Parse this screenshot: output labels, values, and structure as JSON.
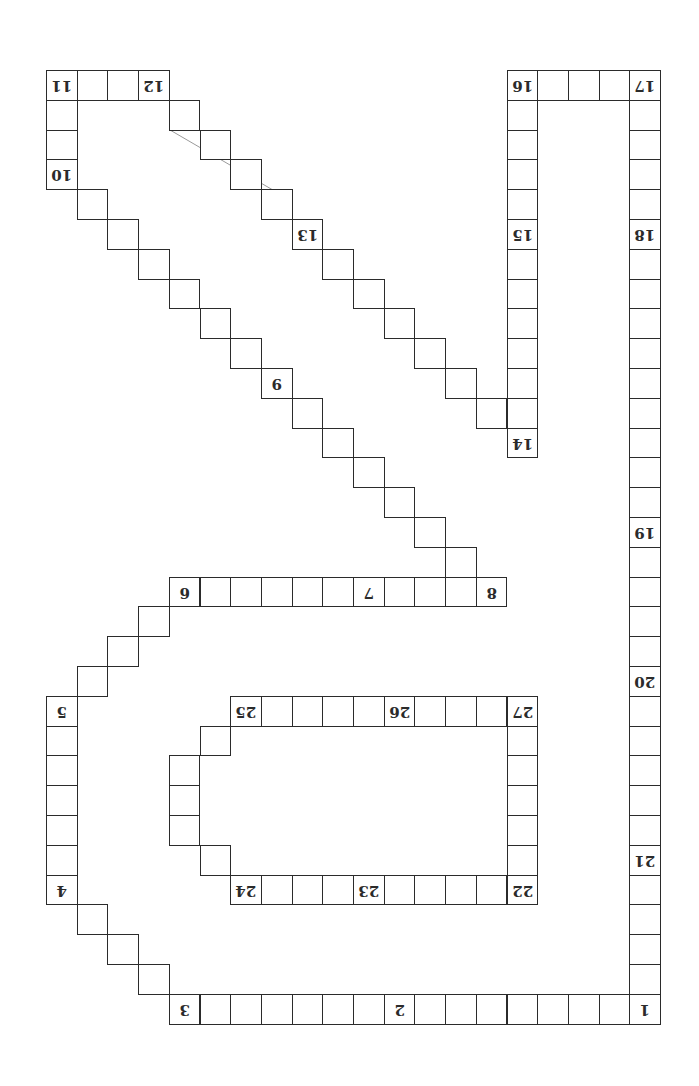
{
  "board": {
    "orientation": "rotated-180",
    "grid": {
      "origin_x": 46,
      "origin_y": 70,
      "col_width": 30.7,
      "row_height": 29.8
    },
    "colors": {
      "line": "#2b2b2b",
      "background": "#ffffff",
      "stray_line": "#9a9a9a"
    },
    "path_cells": [
      {
        "c": 19,
        "r": 31,
        "label": "1"
      },
      {
        "c": 18,
        "r": 31
      },
      {
        "c": 17,
        "r": 31
      },
      {
        "c": 16,
        "r": 31
      },
      {
        "c": 15,
        "r": 31
      },
      {
        "c": 14,
        "r": 31
      },
      {
        "c": 13,
        "r": 31
      },
      {
        "c": 12,
        "r": 31
      },
      {
        "c": 11,
        "r": 31,
        "label": "2"
      },
      {
        "c": 10,
        "r": 31
      },
      {
        "c": 9,
        "r": 31
      },
      {
        "c": 8,
        "r": 31
      },
      {
        "c": 7,
        "r": 31
      },
      {
        "c": 6,
        "r": 31
      },
      {
        "c": 5,
        "r": 31
      },
      {
        "c": 4,
        "r": 31,
        "label": "3"
      },
      {
        "c": 3,
        "r": 30
      },
      {
        "c": 2,
        "r": 29
      },
      {
        "c": 1,
        "r": 28
      },
      {
        "c": 0,
        "r": 27,
        "label": "4"
      },
      {
        "c": 0,
        "r": 26
      },
      {
        "c": 0,
        "r": 25
      },
      {
        "c": 0,
        "r": 24
      },
      {
        "c": 0,
        "r": 23
      },
      {
        "c": 0,
        "r": 22
      },
      {
        "c": 0,
        "r": 21,
        "label": "5"
      },
      {
        "c": 1,
        "r": 20
      },
      {
        "c": 2,
        "r": 19
      },
      {
        "c": 3,
        "r": 18
      },
      {
        "c": 4,
        "r": 17,
        "label": "6"
      },
      {
        "c": 5,
        "r": 17
      },
      {
        "c": 6,
        "r": 17
      },
      {
        "c": 7,
        "r": 17
      },
      {
        "c": 8,
        "r": 17
      },
      {
        "c": 9,
        "r": 17
      },
      {
        "c": 10,
        "r": 17,
        "label": "7"
      },
      {
        "c": 11,
        "r": 17
      },
      {
        "c": 12,
        "r": 17
      },
      {
        "c": 13,
        "r": 17
      },
      {
        "c": 14,
        "r": 17,
        "label": "8"
      },
      {
        "c": 13,
        "r": 16
      },
      {
        "c": 12,
        "r": 15
      },
      {
        "c": 11,
        "r": 14
      },
      {
        "c": 10,
        "r": 13
      },
      {
        "c": 9,
        "r": 12
      },
      {
        "c": 8,
        "r": 11
      },
      {
        "c": 7,
        "r": 10,
        "label": "9"
      },
      {
        "c": 6,
        "r": 9
      },
      {
        "c": 5,
        "r": 8
      },
      {
        "c": 4,
        "r": 7
      },
      {
        "c": 3,
        "r": 6
      },
      {
        "c": 2,
        "r": 5
      },
      {
        "c": 1,
        "r": 4
      },
      {
        "c": 0,
        "r": 3,
        "label": "10"
      },
      {
        "c": 0,
        "r": 2
      },
      {
        "c": 0,
        "r": 1
      },
      {
        "c": 0,
        "r": 0,
        "label": "11"
      },
      {
        "c": 1,
        "r": 0
      },
      {
        "c": 2,
        "r": 0
      },
      {
        "c": 3,
        "r": 0,
        "label": "12"
      },
      {
        "c": 4,
        "r": 1
      },
      {
        "c": 5,
        "r": 2
      },
      {
        "c": 6,
        "r": 3
      },
      {
        "c": 7,
        "r": 4
      },
      {
        "c": 8,
        "r": 5,
        "label": "13"
      },
      {
        "c": 9,
        "r": 6
      },
      {
        "c": 10,
        "r": 7
      },
      {
        "c": 11,
        "r": 8
      },
      {
        "c": 12,
        "r": 9
      },
      {
        "c": 13,
        "r": 10
      },
      {
        "c": 14,
        "r": 11
      },
      {
        "c": 15,
        "r": 12,
        "label": "14"
      },
      {
        "c": 15,
        "r": 11
      },
      {
        "c": 15,
        "r": 10
      },
      {
        "c": 15,
        "r": 9
      },
      {
        "c": 15,
        "r": 8
      },
      {
        "c": 15,
        "r": 7
      },
      {
        "c": 15,
        "r": 6
      },
      {
        "c": 15,
        "r": 5,
        "label": "15"
      },
      {
        "c": 15,
        "r": 4
      },
      {
        "c": 15,
        "r": 3
      },
      {
        "c": 15,
        "r": 2
      },
      {
        "c": 15,
        "r": 1
      },
      {
        "c": 15,
        "r": 0,
        "label": "16"
      },
      {
        "c": 16,
        "r": 0
      },
      {
        "c": 17,
        "r": 0
      },
      {
        "c": 18,
        "r": 0
      },
      {
        "c": 19,
        "r": 0,
        "label": "17"
      },
      {
        "c": 19,
        "r": 1
      },
      {
        "c": 19,
        "r": 2
      },
      {
        "c": 19,
        "r": 3
      },
      {
        "c": 19,
        "r": 4
      },
      {
        "c": 19,
        "r": 5,
        "label": "18"
      },
      {
        "c": 19,
        "r": 6
      },
      {
        "c": 19,
        "r": 7
      },
      {
        "c": 19,
        "r": 8
      },
      {
        "c": 19,
        "r": 9
      },
      {
        "c": 19,
        "r": 10
      },
      {
        "c": 19,
        "r": 11
      },
      {
        "c": 19,
        "r": 12
      },
      {
        "c": 19,
        "r": 13
      },
      {
        "c": 19,
        "r": 14
      },
      {
        "c": 19,
        "r": 15,
        "label": "19"
      },
      {
        "c": 19,
        "r": 16
      },
      {
        "c": 19,
        "r": 17
      },
      {
        "c": 19,
        "r": 18
      },
      {
        "c": 19,
        "r": 19
      },
      {
        "c": 19,
        "r": 20,
        "label": "20"
      },
      {
        "c": 19,
        "r": 21
      },
      {
        "c": 19,
        "r": 22
      },
      {
        "c": 19,
        "r": 23
      },
      {
        "c": 19,
        "r": 24
      },
      {
        "c": 19,
        "r": 25
      },
      {
        "c": 19,
        "r": 26,
        "label": "21"
      },
      {
        "c": 19,
        "r": 27
      },
      {
        "c": 19,
        "r": 28
      },
      {
        "c": 19,
        "r": 29
      },
      {
        "c": 19,
        "r": 30
      }
    ],
    "inner_loop_cells": [
      {
        "c": 15,
        "r": 27,
        "label": "22"
      },
      {
        "c": 14,
        "r": 27
      },
      {
        "c": 13,
        "r": 27
      },
      {
        "c": 12,
        "r": 27
      },
      {
        "c": 11,
        "r": 27
      },
      {
        "c": 10,
        "r": 27,
        "label": "23"
      },
      {
        "c": 9,
        "r": 27
      },
      {
        "c": 8,
        "r": 27
      },
      {
        "c": 7,
        "r": 27
      },
      {
        "c": 6,
        "r": 27,
        "label": "24"
      },
      {
        "c": 5,
        "r": 26
      },
      {
        "c": 4,
        "r": 25
      },
      {
        "c": 4,
        "r": 24
      },
      {
        "c": 4,
        "r": 23
      },
      {
        "c": 5,
        "r": 22
      },
      {
        "c": 6,
        "r": 21,
        "label": "25"
      },
      {
        "c": 7,
        "r": 21
      },
      {
        "c": 8,
        "r": 21
      },
      {
        "c": 9,
        "r": 21
      },
      {
        "c": 10,
        "r": 21
      },
      {
        "c": 11,
        "r": 21,
        "label": "26"
      },
      {
        "c": 12,
        "r": 21
      },
      {
        "c": 13,
        "r": 21
      },
      {
        "c": 14,
        "r": 21
      },
      {
        "c": 15,
        "r": 21,
        "label": "27"
      },
      {
        "c": 15,
        "r": 22
      },
      {
        "c": 15,
        "r": 23
      },
      {
        "c": 15,
        "r": 24
      },
      {
        "c": 15,
        "r": 25
      },
      {
        "c": 15,
        "r": 26
      }
    ],
    "stray_line": {
      "x1": 170,
      "y1": 130,
      "x2": 278,
      "y2": 193
    }
  }
}
